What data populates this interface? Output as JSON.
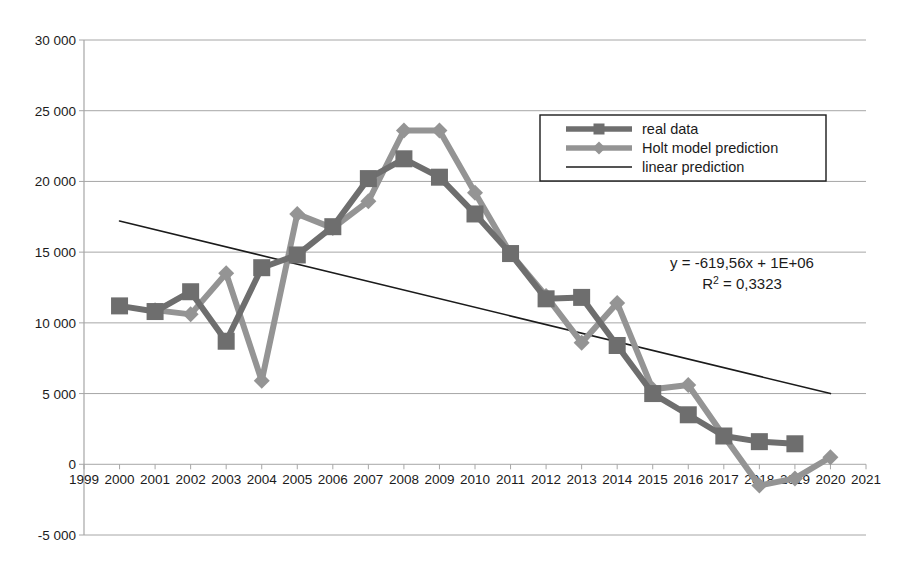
{
  "chart_data": {
    "type": "line",
    "title": "",
    "xlabel": "",
    "ylabel": "",
    "xlim": [
      1999,
      2021
    ],
    "ylim": [
      -5000,
      30000
    ],
    "grid": true,
    "legend_position": "upper right",
    "x_ticks": [
      1999,
      2000,
      2001,
      2002,
      2003,
      2004,
      2005,
      2006,
      2007,
      2008,
      2009,
      2010,
      2011,
      2012,
      2013,
      2014,
      2015,
      2016,
      2017,
      2018,
      2019,
      2020,
      2021
    ],
    "x_tick_labels": [
      "1999",
      "2000",
      "2001",
      "2002",
      "2003",
      "2004",
      "2005",
      "2006",
      "2007",
      "2008",
      "2009",
      "2010",
      "2011",
      "2012",
      "2013",
      "2014",
      "2015",
      "2016",
      "2017",
      "2018",
      "2019",
      "2020",
      "2021"
    ],
    "y_ticks": [
      -5000,
      0,
      5000,
      10000,
      15000,
      20000,
      25000,
      30000
    ],
    "y_tick_labels": [
      "-5 000",
      "0",
      "5 000",
      "10 000",
      "15 000",
      "20 000",
      "25 000",
      "30 000"
    ],
    "series": [
      {
        "name": "real data",
        "marker": "square",
        "color": "#6e6e6e",
        "x": [
          2000,
          2001,
          2002,
          2003,
          2004,
          2005,
          2006,
          2007,
          2008,
          2009,
          2010,
          2011,
          2012,
          2013,
          2014,
          2015,
          2016,
          2017,
          2018,
          2019
        ],
        "values": [
          11200,
          10800,
          12200,
          8700,
          13900,
          14800,
          16800,
          20200,
          21600,
          20300,
          17700,
          14900,
          11700,
          11800,
          8400,
          5000,
          3500,
          2000,
          1600,
          1450
        ]
      },
      {
        "name": "Holt model prediction",
        "marker": "diamond",
        "color": "#949494",
        "x": [
          2001,
          2002,
          2003,
          2004,
          2005,
          2006,
          2007,
          2008,
          2009,
          2010,
          2011,
          2012,
          2013,
          2014,
          2015,
          2016,
          2017,
          2018,
          2019,
          2020
        ],
        "values": [
          10900,
          10600,
          13500,
          5900,
          17700,
          16700,
          18600,
          23600,
          23600,
          19200,
          14900,
          11900,
          8600,
          11400,
          5300,
          5600,
          2000,
          -1500,
          -1000,
          500
        ]
      },
      {
        "name": "linear prediction",
        "marker": "none",
        "color": "#1b1b1b",
        "x": [
          2000,
          2020
        ],
        "values": [
          17200,
          5000
        ]
      }
    ],
    "annotations": [
      {
        "text": "y = -619,56x + 1E+06",
        "x": 2016.2,
        "y": 12100
      },
      {
        "text": "R² = 0,3323",
        "x": 2016.2,
        "y": 10650
      }
    ],
    "equation": {
      "line1": "y = -619,56x + 1E+06",
      "r2_prefix": "R",
      "r2_sup": "2",
      "r2_value": " = 0,3323"
    }
  },
  "legend": {
    "entries": [
      {
        "label": "real data",
        "color": "#6e6e6e",
        "marker": "square"
      },
      {
        "label": "Holt model prediction",
        "color": "#949494",
        "marker": "diamond"
      },
      {
        "label": "linear prediction",
        "color": "#1b1b1b",
        "marker": "none"
      }
    ]
  },
  "colors": {
    "real_data": "#6e6e6e",
    "holt": "#949494",
    "linear": "#1b1b1b",
    "grid": "#a6a6a6",
    "axis": "#a6a6a6",
    "background": "#ffffff",
    "text": "#1b1b1b"
  }
}
